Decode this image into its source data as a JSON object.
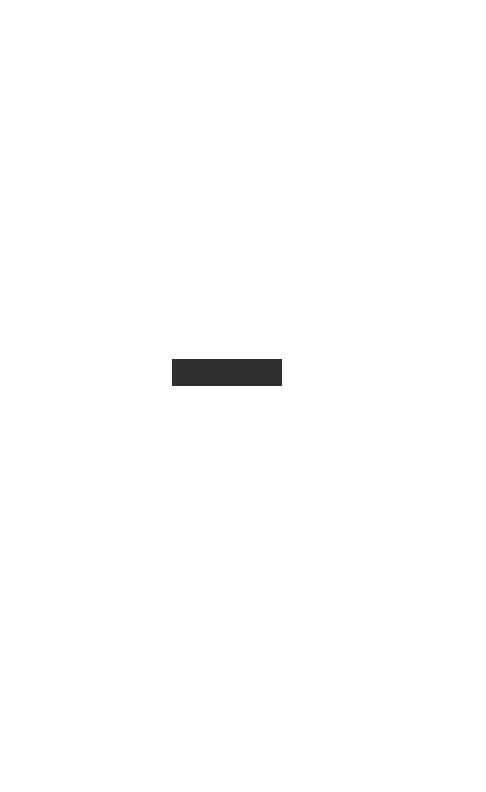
{
  "page": {
    "background_color": "#ffffff",
    "width": 486,
    "height": 792,
    "orientation": "portrait",
    "content_description": "blank-page-with-single-redaction-bar"
  },
  "redaction": {
    "fill_color": "#2f2f2f",
    "text_color": "#3a3a3a",
    "obscured_text": "",
    "x": 172,
    "y": 359,
    "width": 110,
    "height": 27
  }
}
